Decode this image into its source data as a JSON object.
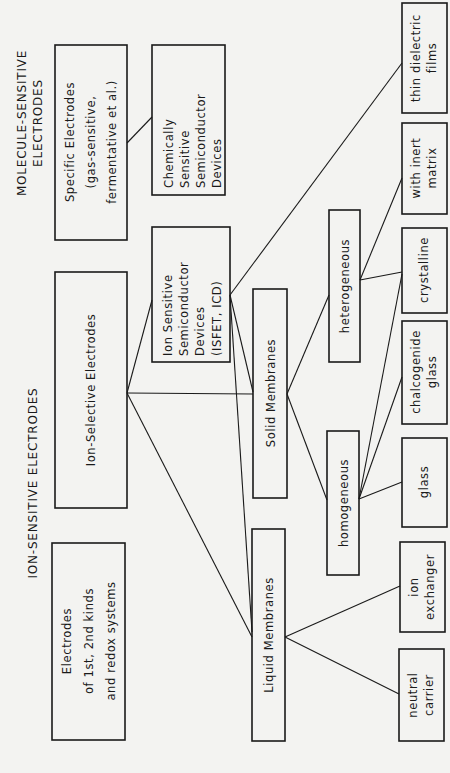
{
  "titles": {
    "molecule_sensitive": [
      "MOLECULE-SENSITIVE",
      "ELECTRODES"
    ],
    "ion_sensitive": [
      "ION-SENSITIVE  ELECTRODES"
    ]
  },
  "nodes": {
    "specific_electrodes": [
      "Specific Electrodes",
      "(gas-sensitive,",
      "fermentative  et al.)"
    ],
    "chemically_sensitive": [
      "Chemically",
      "Sensitive",
      "Semiconductor",
      "Devices"
    ],
    "ion_selective": [
      "Ion-Selective  Electrodes"
    ],
    "ion_sensitive_semiconductor": [
      "Ion Sensitive",
      "Semiconductor",
      "Devices",
      "(ISFET, ICD)"
    ],
    "electrodes_1st_2nd": [
      "Electrodes",
      "of  1st, 2nd  kinds",
      "and  redox systems"
    ],
    "solid_membranes": [
      "Solid  Membranes"
    ],
    "liquid_membranes": [
      "Liquid  Membranes"
    ],
    "heterogeneous": [
      "heterogeneous"
    ],
    "homogeneous": [
      "homogeneous"
    ],
    "thin_dielectric_films": [
      "thin dielectric",
      "films"
    ],
    "with_inert_matrix": [
      "with  inert",
      "matrix"
    ],
    "crystalline": [
      "crystalline"
    ],
    "chalcogenide_glass": [
      "chalcogenide",
      "glass"
    ],
    "glass": [
      "glass"
    ],
    "ion_exchanger": [
      "ion",
      "exchanger"
    ],
    "neutral_carrier": [
      "neutral",
      "carrier"
    ]
  },
  "edges": [
    [
      "specific_electrodes",
      "chemically_sensitive"
    ],
    [
      "ion_selective",
      "ion_sensitive_semiconductor"
    ],
    [
      "ion_selective",
      "solid_membranes"
    ],
    [
      "ion_selective",
      "liquid_membranes"
    ],
    [
      "ion_sensitive_semiconductor",
      "thin_dielectric_films"
    ],
    [
      "ion_sensitive_semiconductor",
      "solid_membranes"
    ],
    [
      "ion_sensitive_semiconductor",
      "liquid_membranes"
    ],
    [
      "solid_membranes",
      "heterogeneous"
    ],
    [
      "solid_membranes",
      "homogeneous"
    ],
    [
      "heterogeneous",
      "with_inert_matrix"
    ],
    [
      "heterogeneous",
      "crystalline"
    ],
    [
      "homogeneous",
      "crystalline"
    ],
    [
      "homogeneous",
      "chalcogenide_glass"
    ],
    [
      "homogeneous",
      "glass"
    ],
    [
      "liquid_membranes",
      "ion_exchanger"
    ],
    [
      "liquid_membranes",
      "neutral_carrier"
    ]
  ]
}
